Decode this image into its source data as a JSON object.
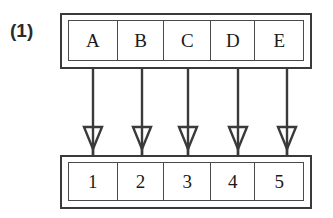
{
  "figure": {
    "label": "(1)",
    "caption_label_name": "figure-number-label",
    "colors": {
      "stroke": "#3a3a3a",
      "inner_stroke": "#4a4a4a",
      "text": "#1a1a1a",
      "background": "#ffffff"
    }
  },
  "diagram_data": {
    "type": "mapping-diagram",
    "description": "Two horizontal arrays of five cells, each top cell mapped by a downward hollow-headed arrow to the cell directly below it.",
    "source_row": {
      "name": "letters-row",
      "cells": [
        "A",
        "B",
        "C",
        "D",
        "E"
      ]
    },
    "target_row": {
      "name": "numbers-row",
      "cells": [
        "1",
        "2",
        "3",
        "4",
        "5"
      ]
    },
    "arrows": [
      {
        "from": "A",
        "to": "1",
        "direction": "down",
        "head": "hollow-triangle",
        "x": 93
      },
      {
        "from": "B",
        "to": "2",
        "direction": "down",
        "head": "hollow-triangle",
        "x": 142
      },
      {
        "from": "C",
        "to": "3",
        "direction": "down",
        "head": "hollow-triangle",
        "x": 188
      },
      {
        "from": "D",
        "to": "4",
        "direction": "down",
        "head": "hollow-triangle",
        "x": 238
      },
      {
        "from": "E",
        "to": "5",
        "direction": "down",
        "head": "hollow-triangle",
        "x": 287
      }
    ]
  }
}
